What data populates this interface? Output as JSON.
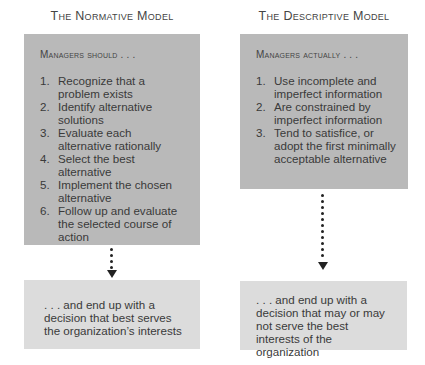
{
  "normative": {
    "title": "The Normative Model",
    "header": "Managers should . . .",
    "steps": [
      {
        "num": "1.",
        "text": "Recognize that a problem exists"
      },
      {
        "num": "2.",
        "text": "Identify alternative solutions"
      },
      {
        "num": "3.",
        "text": "Evaluate each alternative rationally"
      },
      {
        "num": "4.",
        "text": "Select the best alternative"
      },
      {
        "num": "5.",
        "text": "Implement the chosen alternative"
      },
      {
        "num": "6.",
        "text": "Follow up and evaluate the selected course of action"
      }
    ],
    "outcome": ". . . and end up with a decision that best serves the organization’s interests"
  },
  "descriptive": {
    "title": "The Descriptive Model",
    "header": "Managers actually . . .",
    "steps": [
      {
        "num": "1.",
        "text": "Use incomplete and imperfect information"
      },
      {
        "num": "2.",
        "text": "Are constrained by imperfect information"
      },
      {
        "num": "3.",
        "text": "Tend to satisfice, or adopt the first minimally acceptable alternative"
      }
    ],
    "outcome": ". . . and end up with a decision that may or may not serve the best interests of the organization"
  },
  "colors": {
    "process_box": "#b9b9b9",
    "outcome_box": "#dcdcdc",
    "arrow": "#222222"
  }
}
